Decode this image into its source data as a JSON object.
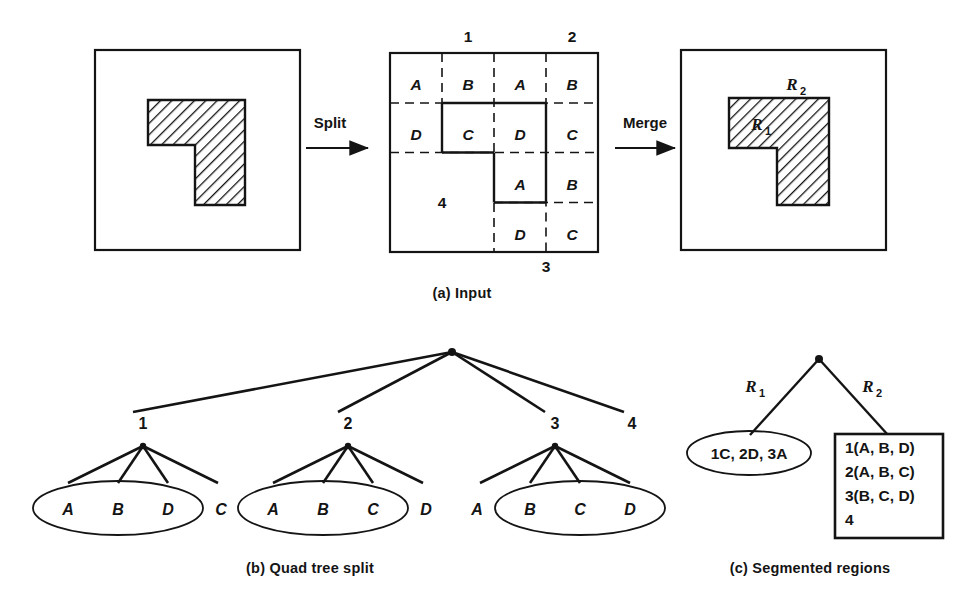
{
  "figure": {
    "stroke_color": "#141414",
    "background": "#ffffff"
  },
  "panel_a": {
    "caption": "(a)  Input",
    "split_arrow_label": "Split",
    "merge_arrow_label": "Merge",
    "left_image": {
      "name": "original-image-with-region"
    },
    "grid": {
      "quadrant_labels": {
        "top_left": "1",
        "top_right": "2",
        "bottom_right": "3",
        "bottom_left": "4"
      },
      "cells": [
        {
          "quadrant": "1",
          "label": "A"
        },
        {
          "quadrant": "1",
          "label": "B"
        },
        {
          "quadrant": "1",
          "label": "D"
        },
        {
          "quadrant": "1",
          "label": "C"
        },
        {
          "quadrant": "2",
          "label": "A"
        },
        {
          "quadrant": "2",
          "label": "B"
        },
        {
          "quadrant": "2",
          "label": "D"
        },
        {
          "quadrant": "2",
          "label": "C"
        },
        {
          "quadrant": "3",
          "label": "A"
        },
        {
          "quadrant": "3",
          "label": "B"
        },
        {
          "quadrant": "3",
          "label": "D"
        },
        {
          "quadrant": "3",
          "label": "C"
        }
      ],
      "letters": {
        "q1_A": "A",
        "q1_B": "B",
        "q1_D": "D",
        "q1_C": "C",
        "q2_A": "A",
        "q2_B": "B",
        "q2_D": "D",
        "q2_C": "C",
        "q3_A": "A",
        "q3_B": "B",
        "q3_D": "D",
        "q3_C": "C",
        "q4": "4",
        "top1": "1",
        "top2": "2",
        "bottom3": "3"
      }
    },
    "merged_image": {
      "region_1_label": "R",
      "region_1_sub": "1",
      "region_2_label": "R",
      "region_2_sub": "2"
    }
  },
  "panel_b": {
    "caption": "(b)  Quad tree split",
    "root": "",
    "level1_nodes": [
      "1",
      "2",
      "3",
      "4"
    ],
    "groups": [
      {
        "parent": "1",
        "ellipse_members": [
          "A",
          "B",
          "D"
        ],
        "outside_members": [
          "C"
        ],
        "order": [
          "A",
          "B",
          "D",
          "C"
        ]
      },
      {
        "parent": "2",
        "ellipse_members": [
          "A",
          "B",
          "C"
        ],
        "outside_members": [
          "D"
        ],
        "order": [
          "A",
          "B",
          "C",
          "D"
        ]
      },
      {
        "parent": "3",
        "ellipse_members": [
          "B",
          "C",
          "D"
        ],
        "outside_members": [
          "A"
        ],
        "order": [
          "A",
          "B",
          "C",
          "D"
        ]
      }
    ],
    "leaves": {
      "g1_A": "A",
      "g1_B": "B",
      "g1_D": "D",
      "g1_C": "C",
      "g2_A": "A",
      "g2_B": "B",
      "g2_C": "C",
      "g2_D": "D",
      "g3_A": "A",
      "g3_B": "B",
      "g3_C": "C",
      "g3_D": "D"
    },
    "node_labels": {
      "n1": "1",
      "n2": "2",
      "n3": "3",
      "n4": "4"
    }
  },
  "panel_c": {
    "caption": "(c)  Segmented regions",
    "branch_left_label": "R",
    "branch_left_sub": "1",
    "branch_right_label": "R",
    "branch_right_sub": "2",
    "ellipse_text": "1C, 2D, 3A",
    "box_lines": [
      "1(A, B, D)",
      "2(A, B, C)",
      "3(B, C, D)",
      "4"
    ],
    "box": {
      "line_0": "1(A, B, D)",
      "line_1": "2(A, B, C)",
      "line_2": "3(B, C, D)",
      "line_3": "4"
    }
  }
}
